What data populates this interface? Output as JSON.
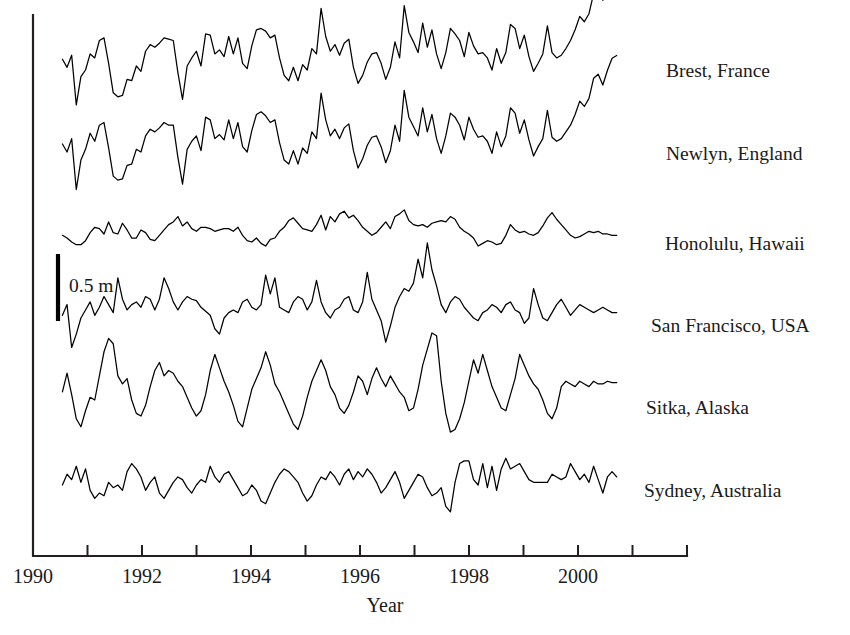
{
  "figure": {
    "background": "#ffffff",
    "ink": "#1a1a1a",
    "line_color": "#000000"
  },
  "axes": {
    "x_title": "Year",
    "x_ticks": [
      "1990",
      "",
      "1992",
      "",
      "1994",
      "",
      "1996",
      "",
      "1998",
      "",
      "2000",
      ""
    ],
    "x_tick_years": [
      1990,
      1991,
      1992,
      1993,
      1994,
      1995,
      1996,
      1997,
      1998,
      1999,
      2000,
      2001
    ],
    "x_min": 1990.0,
    "x_max": 2002.0,
    "y_axis_visible": true,
    "y_ticks_visible": false
  },
  "scale_bar": {
    "label": "0.5 m",
    "meters": 0.5,
    "orientation": "vertical"
  },
  "chart_data": {
    "type": "line",
    "title": "",
    "subtitle": "",
    "xlabel": "Year",
    "ylabel": "",
    "xlim": [
      1990,
      2002
    ],
    "grid": false,
    "legend": "right-inline-labels",
    "units": "m",
    "sampling": "monthly",
    "annotations": [
      "0.5 m"
    ],
    "series": [
      {
        "name": "Brest, France",
        "label": "Brest, France",
        "baseline_px": 70,
        "amplitude_m": 0.5,
        "x_start": 1990.54,
        "x_end": 2000.71,
        "values": [
          0.08,
          0.02,
          0.11,
          -0.26,
          -0.05,
          0.0,
          0.12,
          0.09,
          0.22,
          0.24,
          0.05,
          -0.17,
          -0.2,
          -0.19,
          -0.07,
          -0.08,
          0.03,
          -0.01,
          0.14,
          0.19,
          0.17,
          0.2,
          0.24,
          0.23,
          0.22,
          -0.02,
          -0.22,
          0.03,
          0.09,
          0.14,
          0.03,
          0.27,
          0.26,
          0.12,
          0.15,
          0.1,
          0.25,
          0.12,
          0.24,
          0.05,
          0.01,
          0.18,
          0.3,
          0.31,
          0.29,
          0.24,
          0.26,
          0.09,
          -0.04,
          -0.08,
          0.02,
          -0.08,
          0.04,
          0.0,
          0.16,
          0.12,
          0.46,
          0.25,
          0.14,
          0.19,
          0.11,
          0.2,
          0.23,
          0.02,
          -0.1,
          -0.04,
          0.06,
          0.12,
          0.13,
          0.05,
          -0.07,
          0.02,
          0.21,
          0.09,
          0.48,
          0.28,
          0.21,
          0.13,
          0.35,
          0.17,
          0.3,
          0.12,
          0.01,
          0.13,
          0.31,
          0.27,
          0.22,
          0.1,
          0.28,
          0.18,
          0.12,
          0.13,
          0.09,
          0.0,
          0.16,
          0.05,
          0.13,
          0.34,
          0.31,
          0.16,
          0.26,
          0.1,
          -0.01,
          0.05,
          0.12,
          0.33,
          0.13,
          0.09,
          0.11,
          0.16,
          0.22,
          0.3,
          0.4,
          0.36,
          0.42,
          0.57,
          0.6,
          0.52,
          0.63,
          0.72,
          0.74
        ]
      },
      {
        "name": "Newlyn, England",
        "label": "Newlyn, England",
        "baseline_px": 152,
        "amplitude_m": 0.5,
        "x_start": 1990.54,
        "x_end": 2000.71,
        "values": [
          0.06,
          0.0,
          0.1,
          -0.28,
          -0.06,
          0.02,
          0.14,
          0.08,
          0.2,
          0.22,
          0.03,
          -0.18,
          -0.21,
          -0.2,
          -0.1,
          -0.09,
          0.02,
          0.0,
          0.12,
          0.17,
          0.15,
          0.18,
          0.22,
          0.2,
          0.2,
          -0.04,
          -0.24,
          0.02,
          0.08,
          0.12,
          0.01,
          0.26,
          0.24,
          0.1,
          0.13,
          0.09,
          0.24,
          0.1,
          0.22,
          0.04,
          0.0,
          0.16,
          0.28,
          0.3,
          0.27,
          0.22,
          0.24,
          0.07,
          -0.06,
          -0.09,
          0.01,
          -0.09,
          0.03,
          -0.01,
          0.15,
          0.1,
          0.44,
          0.24,
          0.12,
          0.17,
          0.1,
          0.18,
          0.21,
          0.01,
          -0.12,
          -0.05,
          0.05,
          0.11,
          0.12,
          0.04,
          -0.08,
          0.01,
          0.2,
          0.08,
          0.46,
          0.26,
          0.19,
          0.12,
          0.33,
          0.15,
          0.28,
          0.1,
          -0.01,
          0.12,
          0.29,
          0.26,
          0.2,
          0.09,
          0.26,
          0.17,
          0.11,
          0.12,
          0.08,
          -0.01,
          0.15,
          0.04,
          0.12,
          0.33,
          0.29,
          0.14,
          0.24,
          0.09,
          -0.03,
          0.04,
          0.1,
          0.31,
          0.11,
          0.08,
          0.1,
          0.15,
          0.2,
          0.28,
          0.38,
          0.34,
          0.4,
          0.55,
          0.58,
          0.5,
          0.61,
          0.7,
          0.72
        ]
      },
      {
        "name": "Honolulu, Hawaii",
        "label": "Honolulu, Hawaii",
        "baseline_px": 238,
        "amplitude_m": 0.5,
        "x_start": 1990.54,
        "x_end": 2000.71,
        "values": [
          0.02,
          0.0,
          -0.03,
          -0.05,
          -0.05,
          -0.02,
          0.04,
          0.08,
          0.07,
          0.03,
          0.12,
          0.04,
          0.03,
          0.11,
          0.06,
          0.0,
          0.0,
          0.06,
          0.04,
          -0.01,
          -0.02,
          0.02,
          0.06,
          0.1,
          0.12,
          0.16,
          0.09,
          0.12,
          0.07,
          0.05,
          0.08,
          0.08,
          0.07,
          0.05,
          0.06,
          0.07,
          0.07,
          0.05,
          0.08,
          0.02,
          -0.02,
          -0.03,
          0.0,
          -0.04,
          -0.06,
          -0.01,
          0.0,
          0.05,
          0.08,
          0.13,
          0.15,
          0.11,
          0.07,
          0.06,
          0.05,
          0.1,
          0.17,
          0.06,
          0.16,
          0.12,
          0.18,
          0.2,
          0.15,
          0.17,
          0.13,
          0.08,
          0.05,
          0.02,
          0.04,
          0.08,
          0.12,
          0.07,
          0.16,
          0.18,
          0.21,
          0.13,
          0.1,
          0.09,
          0.1,
          0.08,
          0.11,
          0.12,
          0.13,
          0.12,
          0.16,
          0.14,
          0.08,
          0.05,
          0.03,
          0.0,
          -0.06,
          -0.04,
          -0.02,
          -0.03,
          -0.05,
          -0.04,
          0.02,
          0.1,
          0.06,
          0.04,
          0.05,
          0.03,
          0.02,
          0.04,
          0.09,
          0.15,
          0.19,
          0.14,
          0.1,
          0.06,
          0.02,
          0.0,
          0.01,
          0.03,
          0.05,
          0.04,
          0.05,
          0.03,
          0.03,
          0.02,
          0.02
        ]
      },
      {
        "name": "San Francisco, USA",
        "label": "San Francisco, USA",
        "baseline_px": 318,
        "amplitude_m": 0.5,
        "x_start": 1990.54,
        "x_end": 2000.71,
        "values": [
          0.02,
          0.1,
          -0.22,
          -0.12,
          0.0,
          0.06,
          0.12,
          0.02,
          0.08,
          0.16,
          0.1,
          0.04,
          0.3,
          0.14,
          0.06,
          0.1,
          0.12,
          0.08,
          0.16,
          0.14,
          0.06,
          0.14,
          0.3,
          0.22,
          0.12,
          0.06,
          0.12,
          0.16,
          0.14,
          0.13,
          0.08,
          0.05,
          0.02,
          -0.08,
          -0.12,
          0.0,
          0.04,
          0.06,
          0.04,
          0.12,
          0.14,
          0.08,
          0.06,
          0.1,
          0.32,
          0.18,
          0.3,
          0.08,
          0.06,
          0.04,
          0.12,
          0.16,
          0.14,
          0.06,
          0.12,
          0.28,
          0.12,
          0.04,
          0.0,
          0.06,
          0.08,
          0.14,
          0.16,
          0.06,
          0.04,
          0.12,
          0.34,
          0.14,
          0.06,
          -0.02,
          -0.18,
          -0.06,
          0.08,
          0.16,
          0.22,
          0.2,
          0.26,
          0.44,
          0.3,
          0.56,
          0.36,
          0.24,
          0.1,
          0.04,
          0.12,
          0.16,
          0.14,
          0.08,
          0.04,
          0.0,
          -0.02,
          0.04,
          0.06,
          0.1,
          0.08,
          0.04,
          0.1,
          0.12,
          0.06,
          0.04,
          -0.04,
          0.0,
          0.22,
          0.1,
          0.0,
          -0.02,
          0.04,
          0.1,
          0.14,
          0.08,
          0.02,
          0.06,
          0.1,
          0.08,
          0.06,
          0.04,
          0.06,
          0.08,
          0.06,
          0.04,
          0.04
        ]
      },
      {
        "name": "Sitka, Alaska",
        "label": "Sitka, Alaska",
        "baseline_px": 400,
        "amplitude_m": 0.5,
        "x_start": 1990.54,
        "x_end": 2000.71,
        "values": [
          0.06,
          0.2,
          0.04,
          -0.14,
          -0.2,
          -0.08,
          0.02,
          0.0,
          0.18,
          0.36,
          0.46,
          0.42,
          0.18,
          0.12,
          0.16,
          0.0,
          -0.1,
          -0.12,
          -0.04,
          0.1,
          0.22,
          0.28,
          0.18,
          0.22,
          0.2,
          0.14,
          0.1,
          0.02,
          -0.06,
          -0.12,
          -0.08,
          0.04,
          0.22,
          0.34,
          0.24,
          0.14,
          0.06,
          -0.04,
          -0.16,
          -0.2,
          -0.06,
          0.08,
          0.16,
          0.24,
          0.36,
          0.26,
          0.12,
          0.06,
          -0.02,
          -0.1,
          -0.18,
          -0.22,
          -0.12,
          0.02,
          0.14,
          0.22,
          0.3,
          0.22,
          0.1,
          0.04,
          -0.06,
          -0.1,
          -0.04,
          0.06,
          0.18,
          0.14,
          0.04,
          0.16,
          0.24,
          0.16,
          0.1,
          0.18,
          0.12,
          0.06,
          0.02,
          -0.08,
          -0.06,
          0.08,
          0.26,
          0.38,
          0.5,
          0.48,
          0.14,
          -0.1,
          -0.24,
          -0.22,
          -0.14,
          -0.02,
          0.14,
          0.3,
          0.2,
          0.34,
          0.22,
          0.1,
          0.02,
          -0.06,
          -0.08,
          0.04,
          0.16,
          0.34,
          0.26,
          0.18,
          0.12,
          0.08,
          0.0,
          -0.1,
          -0.14,
          -0.06,
          0.1,
          0.14,
          0.12,
          0.1,
          0.14,
          0.12,
          0.1,
          0.14,
          0.12,
          0.12,
          0.14,
          0.13,
          0.13
        ]
      },
      {
        "name": "Sydney, Australia",
        "label": "Sydney, Australia",
        "baseline_px": 485,
        "amplitude_m": 0.5,
        "x_start": 1990.54,
        "x_end": 2000.71,
        "values": [
          0.0,
          0.08,
          0.04,
          0.14,
          0.02,
          0.12,
          -0.04,
          -0.1,
          -0.06,
          -0.08,
          0.02,
          -0.02,
          0.0,
          -0.04,
          0.1,
          0.16,
          0.12,
          0.06,
          -0.04,
          0.02,
          0.06,
          -0.06,
          -0.1,
          -0.04,
          0.02,
          0.06,
          0.04,
          -0.02,
          -0.06,
          0.0,
          0.04,
          0.02,
          0.14,
          0.06,
          0.02,
          0.08,
          0.1,
          0.04,
          -0.02,
          -0.08,
          -0.06,
          0.0,
          -0.04,
          -0.12,
          -0.14,
          -0.06,
          0.02,
          0.08,
          0.12,
          0.1,
          0.06,
          0.02,
          -0.06,
          -0.12,
          -0.08,
          0.0,
          0.06,
          0.04,
          0.1,
          0.06,
          0.0,
          0.08,
          0.12,
          0.04,
          0.1,
          0.06,
          0.12,
          0.08,
          0.02,
          -0.06,
          -0.02,
          0.04,
          0.1,
          0.02,
          -0.1,
          -0.04,
          0.02,
          0.08,
          0.06,
          -0.02,
          -0.08,
          -0.06,
          -0.02,
          -0.16,
          -0.2,
          0.02,
          0.16,
          0.18,
          0.18,
          0.04,
          0.0,
          0.16,
          -0.02,
          0.14,
          -0.04,
          0.12,
          0.2,
          0.12,
          0.14,
          0.16,
          0.1,
          0.04,
          0.02,
          0.02,
          0.02,
          0.02,
          0.08,
          0.06,
          0.04,
          0.06,
          0.16,
          0.1,
          0.04,
          0.08,
          0.02,
          0.14,
          0.04,
          -0.06,
          0.06,
          0.1,
          0.06
        ]
      }
    ]
  }
}
